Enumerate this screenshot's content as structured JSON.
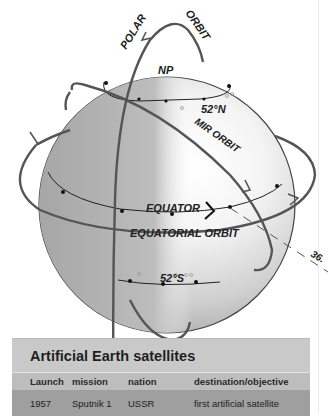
{
  "diagram": {
    "labels": {
      "polar": "POLAR",
      "orbit": "ORBIT",
      "north_pole": "NP",
      "lat_north": "52°N",
      "mir_orbit": "MIR ORBIT",
      "equator": "EQUATOR",
      "equatorial_orbit": "EQUATORIAL ORBIT",
      "lat_south": "52°S",
      "angle": "36."
    },
    "colors": {
      "orbit_line": "#5a5a5a",
      "globe_shadow": "#a8a8a8",
      "globe_light": "#ffffff"
    }
  },
  "table": {
    "title": "Artificial Earth satellites",
    "columns": [
      "Launch",
      "mission",
      "nation",
      "destination/objective"
    ],
    "rows": [
      {
        "launch": "1957",
        "mission": "Sputnik 1",
        "nation": "USSR",
        "objective": "first artificial satellite"
      }
    ]
  }
}
